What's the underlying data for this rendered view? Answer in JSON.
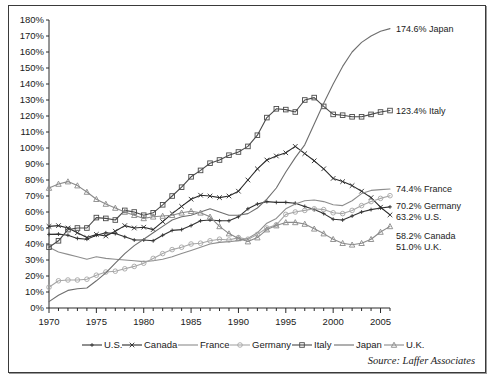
{
  "chart_data": {
    "type": "line",
    "title": "",
    "xlabel": "",
    "ylabel": "",
    "source": "Source: Laffer Associates",
    "grid": false,
    "legend_position": "bottom",
    "xlim": [
      1970,
      2006
    ],
    "ylim": [
      0,
      180
    ],
    "y_ticks": [
      "0%",
      "10%",
      "20%",
      "30%",
      "40%",
      "50%",
      "60%",
      "70%",
      "80%",
      "90%",
      "100%",
      "110%",
      "120%",
      "130%",
      "140%",
      "150%",
      "160%",
      "170%",
      "180%"
    ],
    "y_tick_values": [
      0,
      10,
      20,
      30,
      40,
      50,
      60,
      70,
      80,
      90,
      100,
      110,
      120,
      130,
      140,
      150,
      160,
      170,
      180
    ],
    "x_ticks": [
      "1970",
      "1975",
      "1980",
      "1985",
      "1990",
      "1995",
      "2000",
      "2005"
    ],
    "x_tick_values": [
      1970,
      1975,
      1980,
      1985,
      1990,
      1995,
      2000,
      2005
    ],
    "x": [
      1970,
      1971,
      1972,
      1973,
      1974,
      1975,
      1976,
      1977,
      1978,
      1979,
      1980,
      1981,
      1982,
      1983,
      1984,
      1985,
      1986,
      1987,
      1988,
      1989,
      1990,
      1991,
      1992,
      1993,
      1994,
      1995,
      1996,
      1997,
      1998,
      1999,
      2000,
      2001,
      2002,
      2003,
      2004,
      2005,
      2006
    ],
    "series": [
      {
        "name": "U.S.",
        "marker": "plus",
        "color": "#333333",
        "end_label": "63.2% U.S.",
        "end_value": 63.2,
        "values": [
          46.0,
          46.2,
          45.5,
          43.5,
          43.0,
          45.5,
          47.0,
          46.5,
          44.5,
          42.5,
          42.5,
          42.0,
          45.5,
          48.5,
          49.0,
          51.5,
          54.5,
          55.0,
          54.5,
          54.5,
          57.0,
          62.0,
          65.0,
          66.5,
          66.0,
          66.0,
          65.5,
          63.5,
          61.5,
          59.0,
          55.5,
          55.0,
          57.5,
          60.0,
          61.5,
          62.5,
          63.2
        ]
      },
      {
        "name": "Canada",
        "marker": "x",
        "color": "#2b2b2b",
        "end_label": "58.2% Canada",
        "end_value": 58.2,
        "values": [
          51.0,
          51.5,
          50.0,
          47.0,
          44.0,
          46.0,
          45.0,
          48.0,
          51.5,
          50.0,
          50.5,
          49.0,
          54.0,
          59.0,
          63.5,
          68.0,
          70.5,
          70.0,
          69.0,
          70.0,
          73.0,
          80.0,
          87.0,
          92.5,
          95.0,
          97.0,
          101.0,
          96.5,
          92.0,
          87.0,
          81.0,
          79.0,
          76.5,
          73.0,
          69.0,
          63.0,
          58.2
        ]
      },
      {
        "name": "France",
        "marker": "none",
        "color": "#8d8d8d",
        "end_label": "74.4% France",
        "end_value": 74.4,
        "values": [
          38.0,
          35.0,
          33.5,
          32.0,
          30.5,
          32.0,
          31.0,
          30.5,
          30.0,
          29.5,
          29.0,
          29.5,
          30.5,
          32.0,
          34.0,
          36.0,
          38.0,
          40.0,
          41.0,
          41.5,
          42.0,
          43.5,
          47.0,
          53.0,
          56.0,
          62.0,
          65.0,
          67.0,
          67.5,
          66.5,
          64.5,
          64.0,
          67.0,
          71.5,
          73.5,
          74.0,
          74.4
        ]
      },
      {
        "name": "Germany",
        "marker": "circle",
        "color": "#a6a6a6",
        "end_label": "70.2% Germany",
        "end_value": 70.2,
        "values": [
          13.0,
          17.0,
          17.5,
          17.5,
          18.0,
          20.5,
          22.5,
          23.0,
          24.5,
          26.0,
          28.0,
          31.0,
          34.0,
          36.5,
          38.0,
          40.0,
          40.5,
          42.0,
          43.0,
          42.5,
          44.0,
          43.0,
          46.0,
          50.0,
          52.0,
          58.5,
          60.0,
          61.0,
          62.0,
          61.5,
          59.5,
          59.0,
          61.0,
          64.0,
          66.5,
          68.5,
          70.2
        ]
      },
      {
        "name": "Italy",
        "marker": "square",
        "color": "#4a4a4a",
        "end_label": "123.4% Italy",
        "end_value": 123.4,
        "values": [
          38.0,
          42.0,
          49.0,
          50.0,
          50.0,
          56.5,
          56.0,
          55.0,
          61.0,
          60.0,
          58.0,
          59.5,
          64.5,
          70.0,
          75.5,
          82.0,
          86.0,
          90.5,
          92.5,
          95.5,
          97.5,
          101.0,
          108.0,
          119.0,
          124.5,
          124.0,
          122.5,
          130.0,
          131.5,
          126.0,
          121.0,
          120.5,
          119.5,
          119.5,
          121.0,
          122.5,
          123.4
        ]
      },
      {
        "name": "Japan",
        "marker": "none",
        "color": "#6e6e6e",
        "end_label": "174.6% Japan",
        "end_value": 174.6,
        "values": [
          4.0,
          8.0,
          11.0,
          12.0,
          12.5,
          17.0,
          22.0,
          28.0,
          34.0,
          39.0,
          43.0,
          47.0,
          51.0,
          55.0,
          57.0,
          58.0,
          60.0,
          62.0,
          60.0,
          58.0,
          58.0,
          59.0,
          62.5,
          68.0,
          75.0,
          85.0,
          94.0,
          102.0,
          115.0,
          128.0,
          140.0,
          151.0,
          160.0,
          166.0,
          170.0,
          173.0,
          174.6
        ]
      },
      {
        "name": "U.K.",
        "marker": "triangle",
        "color": "#8a8a8a",
        "end_label": "51.0% U.K.",
        "end_value": 51.0,
        "values": [
          75.0,
          77.5,
          79.0,
          76.5,
          72.5,
          68.0,
          65.0,
          62.5,
          60.0,
          58.0,
          56.0,
          57.0,
          57.5,
          58.0,
          59.5,
          60.5,
          59.5,
          57.0,
          51.0,
          46.5,
          43.5,
          41.5,
          44.0,
          49.0,
          51.5,
          53.5,
          53.5,
          52.5,
          49.5,
          46.5,
          43.0,
          40.5,
          39.5,
          40.5,
          43.0,
          47.5,
          51.0
        ]
      }
    ]
  },
  "legend": {
    "items": [
      {
        "label": "U.S.",
        "marker": "plus"
      },
      {
        "label": "Canada",
        "marker": "x"
      },
      {
        "label": "France",
        "marker": "none"
      },
      {
        "label": "Germany",
        "marker": "circle"
      },
      {
        "label": "Italy",
        "marker": "square"
      },
      {
        "label": "Japan",
        "marker": "none"
      },
      {
        "label": "U.K.",
        "marker": "triangle"
      }
    ]
  },
  "footer": {
    "source": "Source: Laffer Associates"
  }
}
